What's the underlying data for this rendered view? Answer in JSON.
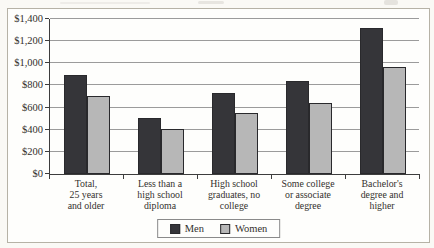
{
  "chart_data": {
    "type": "bar",
    "title": "",
    "categories": [
      "Total,\n25 years\nand older",
      "Less than a\nhigh school\ndiploma",
      "High school\ngraduates, no\ncollege",
      "Some college\nor associate\ndegree",
      "Bachelor's\ndegree and\nhigher"
    ],
    "series": [
      {
        "name": "Men",
        "values": [
          880,
          490,
          715,
          820,
          1300
        ],
        "color": "#353539"
      },
      {
        "name": "Women",
        "values": [
          690,
          385,
          535,
          620,
          950
        ],
        "color": "#b7b7b7"
      }
    ],
    "xlabel": "",
    "ylabel": "",
    "y_tick_labels": [
      "$0",
      "$200",
      "$400",
      "$600",
      "$800",
      "$1,000",
      "$1,200",
      "$1,400"
    ],
    "y_tick_values": [
      0,
      200,
      400,
      600,
      800,
      1000,
      1200,
      1400
    ],
    "ylim": [
      0,
      1400
    ],
    "grid": true,
    "legend_position": "bottom-center"
  },
  "style": {
    "gridline_color": "#9b9b9b",
    "axis_color": "#3d3d3d",
    "frame_border_color": "#b6b2a6",
    "bar_border_color": "#29292c",
    "text_color": "#33302c",
    "background": "#fefefc"
  }
}
